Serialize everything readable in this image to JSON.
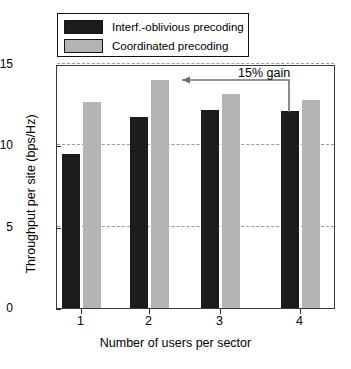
{
  "chart_data": {
    "type": "bar",
    "title": "",
    "xlabel": "Number of users per sector",
    "ylabel": "Throughput per site (bps/Hz)",
    "categories": [
      "1",
      "2",
      "3",
      "4"
    ],
    "series": [
      {
        "name": "Interf.-oblivious precoding",
        "color": "#1c1c1c",
        "values": [
          9.45,
          11.75,
          12.15,
          12.1
        ]
      },
      {
        "name": "Coordinated precoding",
        "color": "#b4b4b4",
        "values": [
          12.65,
          14.0,
          13.15,
          12.8
        ]
      }
    ],
    "ylim": [
      0,
      15
    ],
    "yticks": [
      0,
      5,
      10,
      15
    ],
    "ytick_labels": [
      "0",
      "5",
      "10",
      "15"
    ],
    "xtick_labels": [
      "1",
      "2",
      "3",
      "4"
    ],
    "grid": "horizontal-dashed",
    "legend_position": "top-left-outside",
    "annotations": [
      {
        "text": "15% gain",
        "kind": "arrow-left",
        "from_series": "Coordinated precoding",
        "note": "arrow from group 4 dark bar top pointing left toward group 2"
      }
    ]
  },
  "legend": {
    "items": [
      {
        "label": "Interf.-oblivious precoding",
        "swatch": "dark-swatch"
      },
      {
        "label": "Coordinated precoding",
        "swatch": "light-swatch"
      }
    ]
  },
  "axes": {
    "y_label": "Throughput per site (bps/Hz)",
    "x_label": "Number of users per sector",
    "y_ticks": [
      "15",
      "10",
      "5",
      "0"
    ],
    "x_ticks": [
      "1",
      "2",
      "3",
      "4"
    ]
  },
  "annotation": {
    "label": "15% gain"
  }
}
